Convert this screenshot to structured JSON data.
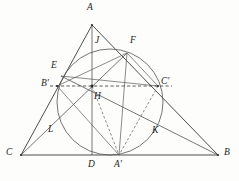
{
  "figure": {
    "kind": "euclidean-geometry-diagram",
    "stroke_color": "#3a3a3a",
    "circle_color": "#5c5c5c",
    "dash_color": "#3f3f3f",
    "background_color": "#fdfdfc"
  },
  "labels": {
    "A": "A",
    "B": "B",
    "C": "C",
    "A_prime": "A'",
    "B_prime": "B'",
    "C_prime": "C'",
    "D": "D",
    "E": "E",
    "F": "F",
    "H": "H",
    "J": "J",
    "K": "K",
    "L": "L"
  },
  "points": {
    "A": {
      "x": 92,
      "y": 25,
      "label_x": 87,
      "label_y": 3
    },
    "B": {
      "x": 218,
      "y": 155,
      "label_x": 224,
      "label_y": 148
    },
    "C": {
      "x": 21,
      "y": 155,
      "label_x": 6,
      "label_y": 148
    },
    "D": {
      "x": 92,
      "y": 155,
      "label_x": 88,
      "label_y": 159
    },
    "E": {
      "x": 61,
      "y": 76,
      "label_x": 51,
      "label_y": 61
    },
    "F": {
      "x": 127,
      "y": 53,
      "label_x": 130,
      "label_y": 36
    },
    "H": {
      "x": 92,
      "y": 86,
      "label_x": 94,
      "label_y": 92
    },
    "A_prime": {
      "x": 119,
      "y": 155,
      "label_x": 115,
      "label_y": 159
    },
    "B_prime": {
      "x": 57,
      "y": 86,
      "label_x": 42,
      "label_y": 79
    },
    "C_prime": {
      "x": 158,
      "y": 86,
      "label_x": 161,
      "label_y": 77
    },
    "J": {
      "x": 104,
      "y": 52,
      "label_x": 95,
      "label_y": 36
    },
    "K": {
      "x": 150,
      "y": 125,
      "label_x": 152,
      "label_y": 126
    },
    "L": {
      "x": 64,
      "y": 124,
      "label_x": 48,
      "label_y": 125
    }
  },
  "nine_point_circle": {
    "center_x": 110,
    "center_y": 102,
    "radius": 53
  },
  "segments": {
    "triangle_sides": [
      {
        "name": "side-AB",
        "from": "A",
        "to": "B"
      },
      {
        "name": "side-BC",
        "from": "B",
        "to": "C"
      },
      {
        "name": "side-CA",
        "from": "C",
        "to": "A"
      }
    ],
    "altitudes": [
      {
        "name": "altitude-A-to-D",
        "from": "A",
        "to": "D"
      },
      {
        "name": "altitude-B-to-E",
        "from": "B",
        "to": "E"
      },
      {
        "name": "altitude-C-to-F",
        "from": "C",
        "to": "F"
      }
    ],
    "chords": [
      {
        "name": "chord-E-to-Cprime",
        "from": "E",
        "to": "C_prime"
      },
      {
        "name": "chord-F-to-Bprime",
        "from": "F",
        "to": "B_prime"
      },
      {
        "name": "chord-Bprime-to-Aprime",
        "from": "B_prime",
        "to": "A_prime"
      },
      {
        "name": "chord-F-to-Aprime",
        "from": "F",
        "to": "A_prime"
      }
    ],
    "dashed": [
      {
        "name": "dashed-Bprime-Cprime-through-H",
        "from": "B_prime",
        "to": "C_prime"
      },
      {
        "name": "dashed-H-to-Aprime",
        "from": "H",
        "to": "A_prime"
      },
      {
        "name": "dashed-Cprime-to-Aprime",
        "from": "C_prime",
        "to": "A_prime"
      }
    ]
  }
}
